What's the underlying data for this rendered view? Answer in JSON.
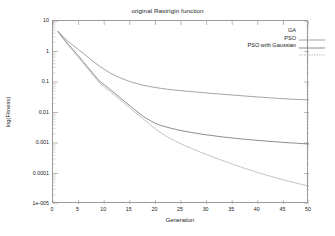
{
  "chart_data": {
    "type": "line",
    "title": "original Rastrigin function",
    "xlabel": "Generation",
    "ylabel": "log(Fitness)",
    "xlim": [
      0,
      50
    ],
    "ylim": [
      1e-05,
      10
    ],
    "yscale": "log",
    "grid": false,
    "legend_position": "top-right",
    "xticks": [
      "0",
      "5",
      "10",
      "15",
      "20",
      "25",
      "30",
      "35",
      "40",
      "45",
      "50"
    ],
    "xtick_values": [
      0,
      5,
      10,
      15,
      20,
      25,
      30,
      35,
      40,
      45,
      50
    ],
    "yticks": [
      "10",
      "1",
      "0.1",
      "0.01",
      "0.001",
      "0.0001",
      "1e-005"
    ],
    "ytick_values": [
      10,
      1,
      0.1,
      0.01,
      0.001,
      0.0001,
      1e-05
    ],
    "x": [
      1,
      2,
      3,
      4,
      5,
      6,
      7,
      8,
      9,
      10,
      11,
      12,
      13,
      14,
      15,
      16,
      17,
      18,
      19,
      20,
      21,
      22,
      23,
      24,
      25,
      26,
      27,
      28,
      29,
      30,
      31,
      32,
      33,
      34,
      35,
      36,
      37,
      38,
      39,
      40,
      41,
      42,
      43,
      44,
      45,
      46,
      47,
      48,
      49,
      50
    ],
    "series": [
      {
        "name": "GA",
        "color": "#8c8c8c",
        "values": [
          4.5,
          3.0,
          2.1,
          1.55,
          1.15,
          0.85,
          0.62,
          0.45,
          0.34,
          0.26,
          0.205,
          0.168,
          0.14,
          0.12,
          0.104,
          0.092,
          0.083,
          0.076,
          0.0705,
          0.066,
          0.0622,
          0.059,
          0.0563,
          0.054,
          0.0519,
          0.05,
          0.0483,
          0.0467,
          0.0452,
          0.0438,
          0.0424,
          0.0411,
          0.0398,
          0.0386,
          0.0374,
          0.0363,
          0.0352,
          0.0342,
          0.0332,
          0.0323,
          0.0314,
          0.0306,
          0.0298,
          0.0291,
          0.0284,
          0.0278,
          0.0272,
          0.0267,
          0.0262,
          0.0258
        ]
      },
      {
        "name": "PSO",
        "color": "#707070",
        "values": [
          4.5,
          2.7,
          1.7,
          1.1,
          0.7,
          0.44,
          0.28,
          0.175,
          0.11,
          0.082,
          0.06,
          0.0435,
          0.0315,
          0.023,
          0.0168,
          0.0122,
          0.009,
          0.0068,
          0.0054,
          0.0044,
          0.0038,
          0.0034,
          0.00305,
          0.00278,
          0.00256,
          0.00238,
          0.00222,
          0.00208,
          0.00196,
          0.00185,
          0.00176,
          0.00167,
          0.00159,
          0.00152,
          0.00146,
          0.0014,
          0.00135,
          0.0013,
          0.00126,
          0.00122,
          0.00118,
          0.00114,
          0.00111,
          0.00108,
          0.00105,
          0.00102,
          0.001,
          0.00097,
          0.00095,
          0.00093
        ]
      },
      {
        "name": "PSO with Gaussian",
        "color": "#a8a8a8",
        "values": [
          4.5,
          2.6,
          1.6,
          1.0,
          0.63,
          0.39,
          0.245,
          0.153,
          0.096,
          0.07,
          0.051,
          0.037,
          0.0268,
          0.0195,
          0.0142,
          0.0103,
          0.0075,
          0.00545,
          0.00396,
          0.00288,
          0.00221,
          0.00172,
          0.00138,
          0.00113,
          0.00094,
          0.00079,
          0.00067,
          0.00057,
          0.00049,
          0.00042,
          0.00036,
          0.00031,
          0.00027,
          0.000235,
          0.000205,
          0.000179,
          0.000157,
          0.000138,
          0.000122,
          0.000108,
          9.58e-05,
          8.54e-05,
          7.65e-05,
          6.87e-05,
          6.19e-05,
          5.6e-05,
          5.08e-05,
          4.62e-05,
          4.22e-05,
          3.87e-05
        ]
      }
    ]
  },
  "legend": {
    "entries": [
      {
        "label": "GA"
      },
      {
        "label": "PSO"
      },
      {
        "label": "PSO with Gaussian"
      }
    ]
  }
}
